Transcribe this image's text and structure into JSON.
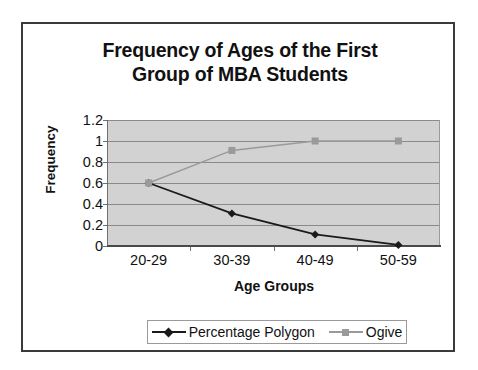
{
  "chart_data": {
    "type": "line",
    "title": "Frequency of Ages of the First Group of MBA Students",
    "title_line1": "Frequency of Ages of the First",
    "title_line2": "Group of MBA Students",
    "xlabel": "Age Groups",
    "ylabel": "Frequency",
    "categories": [
      "20-29",
      "30-39",
      "40-49",
      "50-59"
    ],
    "ytick_labels": [
      "1.2",
      "1",
      "0.8",
      "0.6",
      "0.4",
      "0.2",
      "0"
    ],
    "ytick_values": [
      1.2,
      1,
      0.8,
      0.6,
      0.4,
      0.2,
      0
    ],
    "ylim": [
      0,
      1.2
    ],
    "grid": true,
    "legend_position": "bottom",
    "series": [
      {
        "name": "Percentage Polygon",
        "values": [
          0.6,
          0.31,
          0.11,
          0.01
        ],
        "color": "#1a1a1a",
        "marker": "diamond"
      },
      {
        "name": "Ogive",
        "values": [
          0.6,
          0.91,
          1.0,
          1.0
        ],
        "color": "#9a9a9a",
        "marker": "square"
      }
    ],
    "plot_background": "#d2d2d2",
    "frame_color": "#3a3a3a"
  }
}
